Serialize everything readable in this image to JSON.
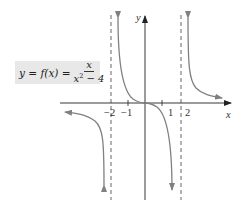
{
  "formula": {
    "lhs": "y = f(x) =",
    "numerator": "x",
    "denominator_base": "x",
    "denominator_exp": "2",
    "denominator_rest": " − 4"
  },
  "axes": {
    "x_label": "x",
    "y_label": "y",
    "tick_labels": {
      "neg2": "−2",
      "neg1": "−1",
      "pos1": "1",
      "pos2": "2"
    }
  },
  "asymptotes": {
    "vertical": [
      "x = −2",
      "x = 2"
    ],
    "horizontal": "y = 0"
  },
  "colors": {
    "axis": "#222222",
    "curve": "#808080",
    "asymptote": "#555555",
    "formula_bg": "#e8e8e8"
  }
}
